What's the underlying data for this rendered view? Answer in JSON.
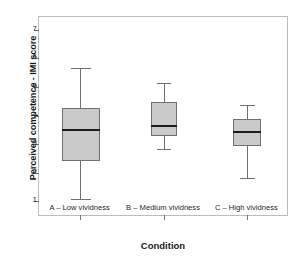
{
  "chart_data": {
    "type": "box",
    "title": "",
    "xlabel": "Condition",
    "ylabel": "Perceived competence - IMI score",
    "ylim": [
      0.45,
      7.45
    ],
    "yticks": [
      1,
      2,
      3,
      4,
      5,
      6,
      7
    ],
    "ytick_labels": [
      "1",
      "2",
      "3",
      "4",
      "5",
      "6",
      "7"
    ],
    "grid": false,
    "legend": "none",
    "categories": [
      "A – Low vividness",
      "B – Medium vividness",
      "C – High vividness"
    ],
    "boxes": [
      {
        "label": "A – Low vividness",
        "whisker_low": 1.08,
        "q1": 2.4,
        "median": 3.5,
        "q3": 4.25,
        "whisker_high": 5.65,
        "outliers": []
      },
      {
        "label": "B – Medium vividness",
        "whisker_low": 2.82,
        "q1": 3.3,
        "median": 3.65,
        "q3": 4.47,
        "whisker_high": 5.13,
        "outliers": []
      },
      {
        "label": "C – High vividness",
        "whisker_low": 1.83,
        "q1": 2.93,
        "median": 3.43,
        "q3": 3.87,
        "whisker_high": 4.38,
        "outliers": []
      }
    ],
    "colors": {
      "box_fill": "#c9c9c9",
      "box_edge": "#707070",
      "median": "#1c1c1c",
      "whisker": "#6f6f6f",
      "frame": "#b9bcc0",
      "background": "#ffffff",
      "text": "#1a1a1a"
    }
  }
}
